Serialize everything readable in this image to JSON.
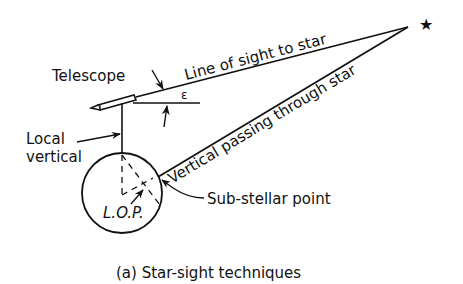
{
  "diagram": {
    "caption": "(a) Star-sight techniques",
    "labels": {
      "telescope": "Telescope",
      "line_of_sight": "Line of sight to star",
      "epsilon": "ε",
      "local_vertical_line1": "Local",
      "local_vertical_line2": "vertical",
      "vertical_through_star": "Vertical passing through star",
      "sub_stellar_point": "Sub-stellar point",
      "lop": "L.O.P."
    },
    "icons": {
      "star": "★"
    },
    "colors": {
      "ink": "#111111",
      "background": "#ffffff"
    }
  }
}
